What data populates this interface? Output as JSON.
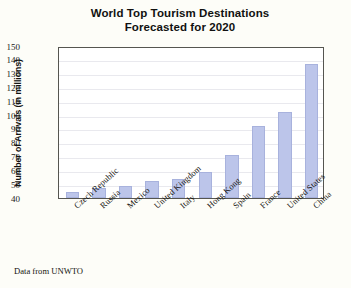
{
  "chart_data": {
    "type": "bar",
    "title": "World Top Tourism Destinations Forecasted for 2020",
    "title_line1": "World Top Tourism Destinations",
    "title_line2": "Forecasted for 2020",
    "xlabel": "",
    "ylabel": "Number of Arrivals (in millions)",
    "ylim": [
      40,
      150
    ],
    "ytick_step": 10,
    "yticks": [
      150,
      140,
      130,
      120,
      110,
      100,
      90,
      80,
      70,
      60,
      50,
      40
    ],
    "grid": true,
    "legend": "none",
    "annotation": "Data from UNWTO",
    "categories": [
      "Czech Republic",
      "Russia",
      "Mexico",
      "United Kingdom",
      "Italy",
      "Hong Kong",
      "Spain",
      "France",
      "United States",
      "China"
    ],
    "values": [
      44,
      47,
      49,
      52,
      54,
      59,
      71,
      92,
      102,
      137
    ],
    "bar_fill_color": "#bcc5ea",
    "bar_border_color": "#a8b2dd",
    "plot_border_color": "#555550",
    "gridline_color": "#e9e9ee",
    "background_color": "#fdfdf8"
  }
}
